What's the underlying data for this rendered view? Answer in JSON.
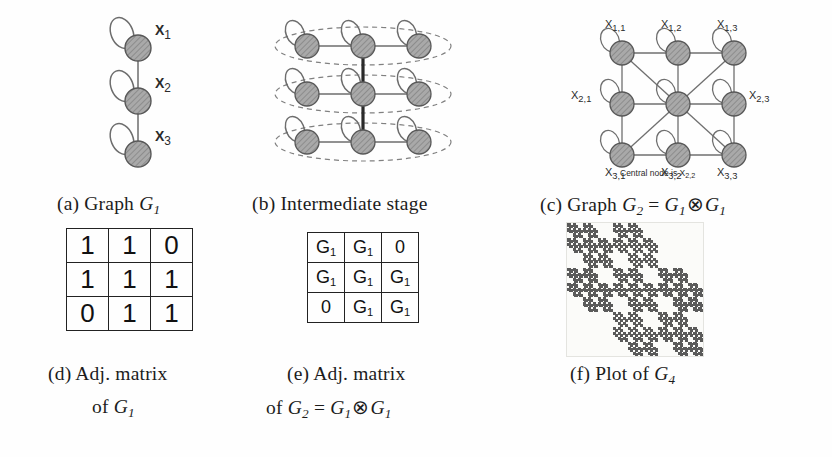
{
  "figure": {
    "type": "kronecker-graph-construction",
    "background": "#fefefe",
    "node_fill": "#a6a6a6",
    "node_stroke": "#555555",
    "edge_color": "#666666",
    "dashed_color": "#777777",
    "fractal_color": "#5a5a5a"
  },
  "panels": {
    "a": {
      "caption_prefix": "(a) Graph ",
      "caption_symbol": "G",
      "caption_sub": "1",
      "node_labels": [
        "X",
        "X",
        "X"
      ],
      "node_subs": [
        "1",
        "2",
        "3"
      ],
      "nodes": 3,
      "description": "three-node chain with self-loops"
    },
    "b": {
      "caption": "(b) Intermediate stage",
      "rows": 3,
      "cols": 3,
      "description": "three stacked rows of three nodes enclosed in dashed ellipses, joined by a vertical spine"
    },
    "c": {
      "caption_prefix": "(c) Graph ",
      "caption_parts": [
        "G",
        "2",
        " = ",
        "G",
        "1",
        " ",
        "G",
        "1"
      ],
      "caption_operator": "⊗",
      "node_labels": [
        {
          "base": "X",
          "sub": "1,1"
        },
        {
          "base": "X",
          "sub": "1,2"
        },
        {
          "base": "X",
          "sub": "1,3"
        },
        {
          "base": "X",
          "sub": "2,1"
        },
        {
          "base": "X",
          "sub": "2,3"
        },
        {
          "base": "X",
          "sub": "3,1"
        },
        {
          "base": "X",
          "sub": "3,2"
        },
        {
          "base": "X",
          "sub": "3,3"
        }
      ],
      "center_note_text": "Central node is X",
      "center_note_sub": "2,2"
    },
    "d": {
      "caption_line1": "(d) Adj. matrix",
      "caption_line2_prefix": "of ",
      "caption_line2_symbol": "G",
      "caption_line2_sub": "1",
      "matrix": [
        [
          "1",
          "1",
          "0"
        ],
        [
          "1",
          "1",
          "1"
        ],
        [
          "0",
          "1",
          "1"
        ]
      ]
    },
    "e": {
      "caption_line1": "(e) Adj. matrix",
      "caption_line2_prefix": "of ",
      "caption_line2_operator": "⊗",
      "matrix": [
        [
          {
            "base": "G",
            "sub": "1"
          },
          {
            "base": "G",
            "sub": "1"
          },
          {
            "base": "0",
            "sub": ""
          }
        ],
        [
          {
            "base": "G",
            "sub": "1"
          },
          {
            "base": "G",
            "sub": "1"
          },
          {
            "base": "G",
            "sub": "1"
          }
        ],
        [
          {
            "base": "0",
            "sub": ""
          },
          {
            "base": "G",
            "sub": "1"
          },
          {
            "base": "G",
            "sub": "1"
          }
        ]
      ]
    },
    "f": {
      "caption_prefix": "(f) Plot of ",
      "caption_symbol": "G",
      "caption_sub": "4"
    }
  },
  "chart_data": {
    "type": "heatmap",
    "title": "Plot of G4",
    "base_matrix": [
      [
        1,
        1,
        0
      ],
      [
        1,
        1,
        1
      ],
      [
        0,
        1,
        1
      ]
    ],
    "kronecker_power": 4,
    "size": 81,
    "xlabel": "",
    "ylabel": "",
    "grid": false,
    "legend": "none",
    "on_color": "#5a5a5a",
    "off_color": "#fbfbf9"
  }
}
